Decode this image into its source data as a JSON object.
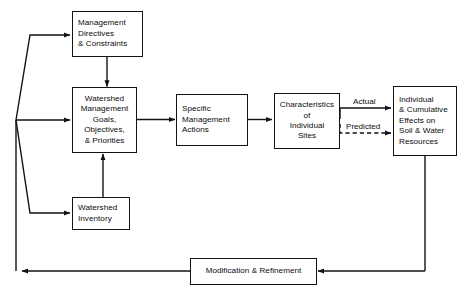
{
  "diagram": {
    "line_color": "#131313",
    "background_color": "#ffffff",
    "nodes": [
      {
        "id": "management-directives",
        "lines": [
          "Management",
          "Directives",
          "& Constraints"
        ],
        "align": "left"
      },
      {
        "id": "watershed-management-goals",
        "lines": [
          "Watershed",
          "Management",
          "Goals,",
          "Objectives,",
          "& Priorities"
        ],
        "align": "center"
      },
      {
        "id": "watershed-inventory",
        "lines": [
          "Watershed",
          "Inventory"
        ],
        "align": "left"
      },
      {
        "id": "specific-management-actions",
        "lines": [
          "Specific",
          "Management",
          "Actions"
        ],
        "align": "left"
      },
      {
        "id": "characteristics-individual-sites",
        "lines": [
          "Characteristics",
          "of",
          "Individual",
          "Sites"
        ],
        "align": "center"
      },
      {
        "id": "individual-cumulative-effects",
        "lines": [
          "Individual",
          "& Cumulative",
          "Effects on",
          "Soil & Water",
          "Resources"
        ],
        "align": "left"
      },
      {
        "id": "modification-refinement",
        "lines": [
          "Modification & Refinement"
        ],
        "align": "left"
      }
    ],
    "edge_labels": [
      {
        "id": "actual",
        "text": "Actual",
        "style": "solid"
      },
      {
        "id": "predicted",
        "text": "Predicted",
        "style": "dashed"
      }
    ]
  }
}
